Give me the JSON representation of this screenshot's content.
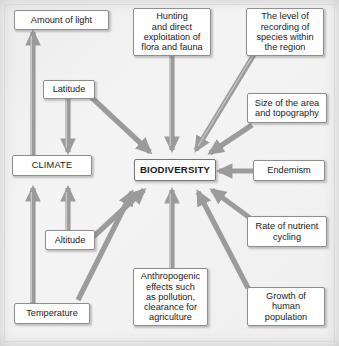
{
  "diagram": {
    "center": {
      "id": "biodiversity",
      "label": "BIODIVERSITY"
    },
    "nodes": [
      {
        "id": "amount-of-light",
        "label": "Amount of light"
      },
      {
        "id": "hunting",
        "label": "Hunting\nand direct\nexploitation of\nflora and fauna"
      },
      {
        "id": "level-of-recording",
        "label": "The level of\nrecording of\nspecies within\nthe region"
      },
      {
        "id": "latitude",
        "label": "Latitude"
      },
      {
        "id": "size-of-area",
        "label": "Size of the area\nand topography"
      },
      {
        "id": "climate",
        "label": "CLIMATE"
      },
      {
        "id": "endemism",
        "label": "Endemism"
      },
      {
        "id": "altitude",
        "label": "Altitude"
      },
      {
        "id": "rate-of-nutrient-cycling",
        "label": "Rate of nutrient\ncycling"
      },
      {
        "id": "anthropogenic",
        "label": "Anthropogenic\neffects such\nas pollution,\nclearance for\nagriculture"
      },
      {
        "id": "temperature",
        "label": "Temperature"
      },
      {
        "id": "growth-of-human-population",
        "label": "Growth of\nhuman\npopulation"
      }
    ],
    "edges": [
      {
        "from": "hunting",
        "to": "biodiversity"
      },
      {
        "from": "level-of-recording",
        "to": "biodiversity"
      },
      {
        "from": "latitude",
        "to": "biodiversity"
      },
      {
        "from": "size-of-area",
        "to": "biodiversity"
      },
      {
        "from": "endemism",
        "to": "biodiversity"
      },
      {
        "from": "rate-of-nutrient-cycling",
        "to": "biodiversity"
      },
      {
        "from": "growth-of-human-population",
        "to": "biodiversity"
      },
      {
        "from": "anthropogenic",
        "to": "biodiversity"
      },
      {
        "from": "altitude",
        "to": "biodiversity"
      },
      {
        "from": "temperature",
        "to": "biodiversity"
      },
      {
        "from": "climate",
        "to": "biodiversity"
      },
      {
        "from": "climate",
        "to": "amount-of-light"
      },
      {
        "from": "latitude",
        "to": "climate"
      },
      {
        "from": "altitude",
        "to": "climate"
      },
      {
        "from": "temperature",
        "to": "climate"
      }
    ],
    "colors": {
      "arrow": "#9b9b9b",
      "arrow_highlight": "#c9c9c9",
      "box_border": "#8e8e8e",
      "box_fill": "#ffffff",
      "background": "#efefef",
      "text": "#1a1a1a"
    }
  }
}
